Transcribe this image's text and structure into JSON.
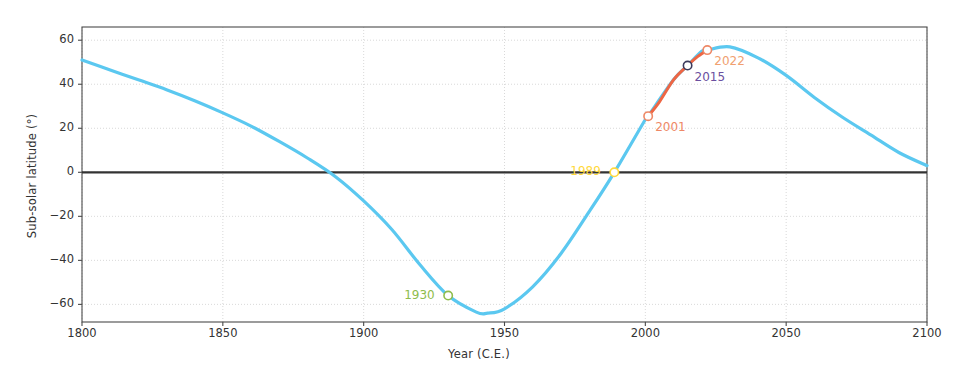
{
  "chart_data": {
    "type": "line",
    "title": "",
    "xlabel": "Year (C.E.)",
    "ylabel": "Sub-solar latitude (°)",
    "xlim": [
      1800,
      2100
    ],
    "ylim": [
      -68,
      66
    ],
    "xticks": [
      1800,
      1850,
      1900,
      1950,
      2000,
      2050,
      2100
    ],
    "yticks": [
      60,
      40,
      20,
      0,
      -20,
      -40,
      -60
    ],
    "grid": true,
    "legend": "none",
    "series": [
      {
        "name": "sub-solar latitude",
        "color": "#5bc8f0",
        "x": [
          1800,
          1810,
          1820,
          1830,
          1840,
          1850,
          1860,
          1870,
          1880,
          1890,
          1900,
          1910,
          1920,
          1930,
          1940,
          1944,
          1950,
          1960,
          1970,
          1980,
          1989,
          2000,
          2001,
          2010,
          2015,
          2020,
          2022,
          2030,
          2040,
          2050,
          2060,
          2070,
          2080,
          2090,
          2100
        ],
        "y": [
          51,
          46.5,
          42,
          37.5,
          32.5,
          27,
          21,
          14,
          6.5,
          -2,
          -13,
          -26,
          -42,
          -56,
          -63.5,
          -64,
          -62,
          -52,
          -37,
          -18,
          0,
          24,
          25.5,
          42,
          48.5,
          55,
          55.5,
          57,
          52,
          44,
          34,
          25,
          17,
          9,
          3
        ]
      },
      {
        "name": "observed interval 2001-2022",
        "color": "#ee6644",
        "x": [
          2001,
          2005,
          2010,
          2015,
          2018,
          2022
        ],
        "y": [
          25.5,
          32,
          42,
          48.5,
          52,
          55.5
        ]
      }
    ],
    "reference_line": {
      "name": "equator",
      "y": 0,
      "color": "#333333"
    },
    "annotations": [
      {
        "label": "1930",
        "x": 1930,
        "y": -56,
        "color": "#8fbc4b",
        "marker_color": "#8fbc4b",
        "text_anchor": "right"
      },
      {
        "label": "1989",
        "x": 1989,
        "y": 0,
        "color": "#ffd93b",
        "marker_color": "#ffd93b",
        "text_anchor": "right"
      },
      {
        "label": "2001",
        "x": 2001,
        "y": 25.5,
        "color": "#ee8866",
        "marker_color": "#ee8866",
        "text_anchor": "left"
      },
      {
        "label": "2015",
        "x": 2015,
        "y": 48.5,
        "color": "#6b4fa0",
        "marker_color": "#3b3b5c",
        "text_anchor": "left"
      },
      {
        "label": "2022",
        "x": 2022,
        "y": 55.5,
        "color": "#f0a070",
        "marker_color": "#ee8866",
        "text_anchor": "left"
      }
    ]
  }
}
